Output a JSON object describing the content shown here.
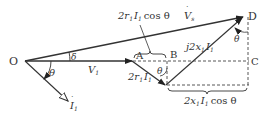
{
  "diagram": {
    "type": "phasor-diagram",
    "points": {
      "O": "O",
      "A": "A",
      "B": "B",
      "C": "C",
      "D": "D"
    },
    "labels": {
      "V1": "V",
      "V1_sub": "1",
      "Vs": "V",
      "Vs_sub": "s",
      "I1": "I",
      "I1_sub": "1",
      "theta": "θ",
      "delta": "δ",
      "r_drop_prefix": "2r",
      "r_drop_sub": "1",
      "r_drop_I": "I",
      "r_drop_Isub": "1",
      "x_drop_prefix": "j2x",
      "x_drop_sub": "1",
      "x_drop_I": "I",
      "x_drop_Isub": "1",
      "r_cos_prefix": "2r",
      "r_cos_sub": "1",
      "r_cos_I": "I",
      "r_cos_Isub": "1",
      "r_cos_suffix": "cos θ",
      "x_cos_prefix": "2x",
      "x_cos_sub": "1",
      "x_cos_I": "I",
      "x_cos_Isub": "1",
      "x_cos_suffix": "cos θ"
    },
    "colors": {
      "line": "#333333",
      "dashed": "#444444"
    }
  }
}
